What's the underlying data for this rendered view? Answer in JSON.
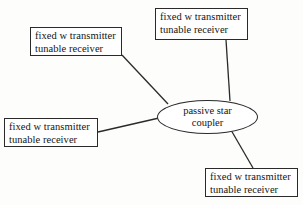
{
  "diagram": {
    "type": "network-topology",
    "hub": {
      "shape": "ellipse",
      "line1": "passive star",
      "line2": "coupler"
    },
    "node_label": {
      "line1": "fixed w transmitter",
      "line2": "tunable receiver"
    },
    "nodes": [
      {
        "id": "top-left",
        "position": "top-left",
        "line1": "fixed w transmitter",
        "line2": "tunable receiver"
      },
      {
        "id": "top-right",
        "position": "top-right",
        "line1": "fixed w transmitter",
        "line2": "tunable receiver"
      },
      {
        "id": "left",
        "position": "left",
        "line1": "fixed w transmitter",
        "line2": "tunable receiver"
      },
      {
        "id": "bottom-right",
        "position": "bottom-right",
        "line1": "fixed w transmitter",
        "line2": "tunable receiver"
      }
    ],
    "links": [
      {
        "id": "link-top-left",
        "from": "top-left",
        "to": "hub",
        "x1": 122,
        "y1": 55,
        "x2": 168,
        "y2": 104
      },
      {
        "id": "link-top-right",
        "from": "top-right",
        "to": "hub",
        "x1": 226,
        "y1": 40,
        "x2": 230,
        "y2": 101
      },
      {
        "id": "link-left",
        "from": "left",
        "to": "hub",
        "x1": 98,
        "y1": 132,
        "x2": 159,
        "y2": 118
      },
      {
        "id": "link-bottom-right",
        "from": "bottom-right",
        "to": "hub",
        "x1": 253,
        "y1": 168,
        "x2": 231,
        "y2": 130
      }
    ],
    "colors": {
      "background": "#fdfdfc",
      "stroke": "#2a2a2a",
      "text": "#141414",
      "box_fill": "#ffffff"
    }
  }
}
